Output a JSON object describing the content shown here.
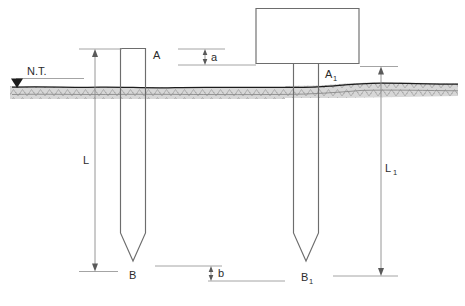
{
  "figure": {
    "type": "engineering-section-diagram",
    "background_color": "#ffffff",
    "line_color": "#6d6d6d",
    "ground_color": "#1c1c1c",
    "dimension_color": "#8a8a8a",
    "text_color": "#2b2b2b"
  },
  "labels": {
    "natural_terrain": "N.T.",
    "pile_left_top": "A",
    "pile_left_tip": "B",
    "pile_right_top": "A",
    "pile_right_top_sub": "1",
    "pile_right_tip": "B",
    "pile_right_tip_sub": "1",
    "length_left": "L",
    "length_right": "L",
    "length_right_sub": "1",
    "offset_top": "a",
    "offset_bottom": "b"
  },
  "elements": {
    "left_pile": {
      "name": "driven-pile-left",
      "top_label": "A",
      "tip_label": "B",
      "length_label": "L"
    },
    "right_pile": {
      "name": "driven-pile-right",
      "top_label": "A1",
      "tip_label": "B1",
      "length_label": "L1",
      "has_footing_cap": true
    },
    "footing_cap": {
      "name": "footing-cap-block"
    },
    "ground": {
      "name": "natural-terrain-line",
      "marker_label": "N.T."
    }
  },
  "dimensions": [
    {
      "id": "L",
      "label": "L",
      "subscript": "",
      "description": "Embedded length of left pile from top to tip"
    },
    {
      "id": "L1",
      "label": "L",
      "subscript": "1",
      "description": "Embedded length of right pile from top to tip"
    },
    {
      "id": "a",
      "label": "a",
      "subscript": "",
      "description": "Vertical offset between left pile head and right pile head level"
    },
    {
      "id": "b",
      "label": "b",
      "subscript": "",
      "description": "Vertical offset between left pile tip and right pile tip level"
    }
  ]
}
